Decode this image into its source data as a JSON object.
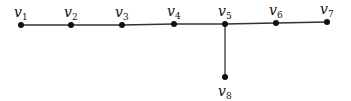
{
  "diagram": {
    "type": "graph",
    "title": "",
    "colors": {
      "edge": "#333333",
      "node": "#111111",
      "background": "#ffffff"
    },
    "nodes": [
      {
        "id": "v1",
        "label": "v",
        "sub": "1",
        "x": 21,
        "y": 25,
        "lx": 14,
        "ly": 17,
        "lpos": "above"
      },
      {
        "id": "v2",
        "label": "v",
        "sub": "2",
        "x": 71,
        "y": 25,
        "lx": 64,
        "ly": 17,
        "lpos": "above"
      },
      {
        "id": "v3",
        "label": "v",
        "sub": "3",
        "x": 122,
        "y": 25,
        "lx": 115,
        "ly": 17,
        "lpos": "above"
      },
      {
        "id": "v4",
        "label": "v",
        "sub": "4",
        "x": 174,
        "y": 24,
        "lx": 167,
        "ly": 16,
        "lpos": "above"
      },
      {
        "id": "v5",
        "label": "v",
        "sub": "5",
        "x": 225,
        "y": 24,
        "lx": 218,
        "ly": 16,
        "lpos": "above"
      },
      {
        "id": "v6",
        "label": "v",
        "sub": "6",
        "x": 276,
        "y": 23,
        "lx": 269,
        "ly": 15,
        "lpos": "above"
      },
      {
        "id": "v7",
        "label": "v",
        "sub": "7",
        "x": 327,
        "y": 22,
        "lx": 320,
        "ly": 14,
        "lpos": "above"
      },
      {
        "id": "v8",
        "label": "v",
        "sub": "8",
        "x": 225,
        "y": 77,
        "lx": 218,
        "ly": 96,
        "lpos": "below"
      }
    ],
    "edges": [
      [
        "v1",
        "v2"
      ],
      [
        "v2",
        "v3"
      ],
      [
        "v3",
        "v4"
      ],
      [
        "v4",
        "v5"
      ],
      [
        "v5",
        "v6"
      ],
      [
        "v6",
        "v7"
      ],
      [
        "v5",
        "v8"
      ]
    ]
  }
}
